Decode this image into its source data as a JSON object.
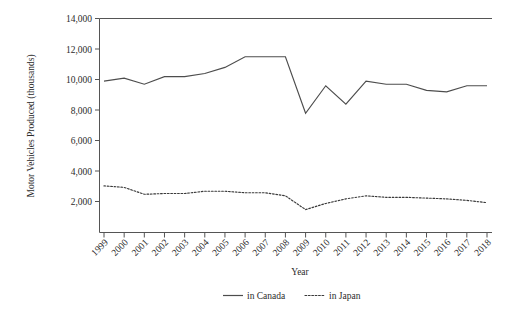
{
  "chart_data": {
    "type": "line",
    "title": "",
    "xlabel": "Year",
    "ylabel": "Motor Vehicles Produced (thousands)",
    "categories": [
      "1999",
      "2000",
      "2001",
      "2002",
      "2003",
      "2004",
      "2005",
      "2006",
      "2007",
      "2008",
      "2009",
      "2010",
      "2011",
      "2012",
      "2013",
      "2014",
      "2015",
      "2016",
      "2017",
      "2018"
    ],
    "series": [
      {
        "name": "in Canada",
        "style": "solid",
        "color": "#4d4d4d",
        "values": [
          9900,
          10100,
          9700,
          10200,
          10200,
          10400,
          10800,
          11500,
          11500,
          11500,
          7800,
          9600,
          8400,
          9900,
          9700,
          9700,
          9300,
          9200,
          9600,
          9600
        ]
      },
      {
        "name": "in Japan",
        "style": "dotted",
        "color": "#3a3a3a",
        "values": [
          3050,
          2950,
          2500,
          2550,
          2550,
          2700,
          2700,
          2600,
          2600,
          2400,
          1500,
          1900,
          2200,
          2400,
          2300,
          2300,
          2250,
          2200,
          2100,
          1950
        ]
      }
    ],
    "ylim": [
      0,
      14000
    ],
    "yticks": [
      2000,
      4000,
      6000,
      8000,
      10000,
      12000,
      14000
    ],
    "ytick_labels": [
      "2,000",
      "4,000",
      "6,000",
      "8,000",
      "10,000",
      "12,000",
      "14,000"
    ],
    "grid": false,
    "legend_position": "bottom",
    "legend_entries": [
      "in Canada",
      "in Japan"
    ]
  }
}
